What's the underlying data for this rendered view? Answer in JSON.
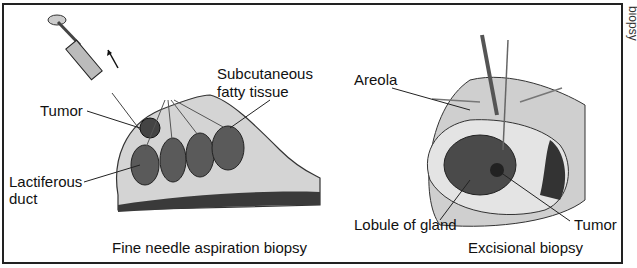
{
  "figure": {
    "panels": [
      {
        "id": "fine-needle",
        "caption": "Fine needle aspiration biopsy",
        "labels": {
          "tumor": "Tumor",
          "subcutaneous": "Subcutaneous",
          "fatty_tissue": "fatty tissue",
          "lactiferous": "Lactiferous",
          "duct": "duct"
        }
      },
      {
        "id": "excisional",
        "caption": "Excisional biopsy",
        "labels": {
          "areola": "Areola",
          "lobule": "Lobule of gland",
          "tumor": "Tumor"
        }
      }
    ],
    "edge_fragment": "biopsy",
    "colors": {
      "tissue_fill": "#cfcfcf",
      "lobule": "#5a5a5a",
      "muscle": "#3a3a3a",
      "line": "#222222"
    }
  }
}
